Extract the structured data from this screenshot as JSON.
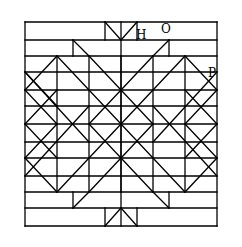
{
  "diagram": {
    "type": "geometric-pattern",
    "line_color": "#000000",
    "background_color": "#ffffff",
    "labels": [
      {
        "id": "H",
        "text": "H"
      },
      {
        "id": "O",
        "text": "O"
      },
      {
        "id": "P",
        "text": "P"
      }
    ]
  }
}
